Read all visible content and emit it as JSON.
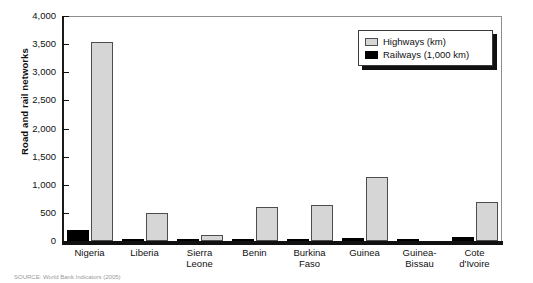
{
  "chart_data": {
    "type": "bar",
    "title": "",
    "xlabel": "",
    "ylabel": "Road and rail networks",
    "ylim": [
      0,
      4000
    ],
    "ytick_labels": [
      "0",
      "500",
      "1,000",
      "1,500",
      "2,000",
      "2,500",
      "3,000",
      "3,500",
      "4,000"
    ],
    "ytick_values": [
      0,
      500,
      1000,
      1500,
      2000,
      2500,
      3000,
      3500,
      4000
    ],
    "grid": false,
    "legend_position": "top-right",
    "categories": [
      "Nigeria",
      "Liberia",
      "Sierra Leone",
      "Benin",
      "Burkina Faso",
      "Guinea",
      "Guinea-Bissau",
      "Cote d'Ivoire"
    ],
    "category_lines": [
      [
        "Nigeria"
      ],
      [
        "Liberia"
      ],
      [
        "Sierra",
        "Leone"
      ],
      [
        "Benin"
      ],
      [
        "Burkina",
        "Faso"
      ],
      [
        "Guinea"
      ],
      [
        "Guinea-",
        "Bissau"
      ],
      [
        "Cote",
        "d'Ivoire"
      ]
    ],
    "series": [
      {
        "name": "Highways (km)",
        "color": "#d6d6d6",
        "values": [
          3540,
          500,
          115,
          600,
          640,
          1145,
          0,
          700
        ]
      },
      {
        "name": "Railways (1,000 km)",
        "color": "#000000",
        "values": [
          190,
          8,
          8,
          8,
          8,
          45,
          8,
          65
        ]
      }
    ]
  },
  "legend": {
    "items": [
      {
        "label": "Highways (km)",
        "swatch": "highways-swatch"
      },
      {
        "label": "Railways (1,000 km)",
        "swatch": "railways-swatch"
      }
    ]
  },
  "source_note": "SOURCE: World Bank Indicators (2005)"
}
